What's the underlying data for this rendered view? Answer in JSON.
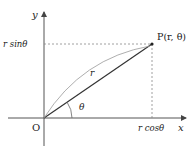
{
  "diagram": {
    "axes": {
      "x_label": "x",
      "y_label": "y",
      "origin_label": "O"
    },
    "point": {
      "label": "P(r, θ)"
    },
    "segment_label": "r",
    "angle_label": "θ",
    "projection_labels": {
      "y_projection": "r sinθ",
      "x_projection": "r cosθ"
    },
    "colors": {
      "axis": "#444444",
      "segment": "#333333",
      "dashed": "#888888",
      "arc": "#777777",
      "text": "#222222"
    }
  }
}
